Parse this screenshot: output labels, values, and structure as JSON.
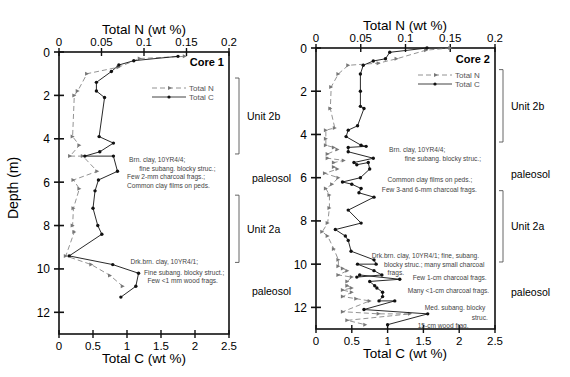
{
  "figure": {
    "y_axis_label": "Depth (m)",
    "top_axis_label": "Total N (wt %)",
    "bottom_axis_label": "Total C (wt %)"
  },
  "chart_data": [
    {
      "type": "line",
      "title": "Core 1",
      "ylabel": "Depth (m)",
      "xlabel_bottom": "Total C (wt %)",
      "xlabel_top": "Total N (wt %)",
      "ylim": [
        13,
        0
      ],
      "xlim_bottom": [
        0,
        2.5
      ],
      "xlim_top": [
        0,
        0.2
      ],
      "y_ticks": [
        0,
        2,
        4,
        6,
        8,
        10,
        12
      ],
      "x_ticks_bottom": [
        0,
        0.5,
        1,
        1.5,
        2,
        2.5
      ],
      "x_ticks_top": [
        0,
        0.05,
        0.1,
        0.15,
        0.2
      ],
      "x_tick_labels_bottom": [
        "0",
        "0.5",
        "1",
        "1.5",
        "2",
        "2.5"
      ],
      "x_tick_labels_top": [
        "0",
        "0.05",
        "0.1",
        "0.15",
        "0.2"
      ],
      "legend": [
        "Total N",
        "Total C"
      ],
      "legend_position": "upper right",
      "grid": false,
      "series": [
        {
          "name": "Total N",
          "axis": "top",
          "style": "dashed",
          "marker": "arrow",
          "color": "#777777",
          "points": [
            [
              0.148,
              0.2
            ],
            [
              0.095,
              0.3
            ],
            [
              0.07,
              0.7
            ],
            [
              0.033,
              1.0
            ],
            [
              0.022,
              1.8
            ],
            [
              0.018,
              2.0
            ],
            [
              0.016,
              3.9
            ],
            [
              0.024,
              4.3
            ],
            [
              0.013,
              4.8
            ],
            [
              0.028,
              4.8
            ],
            [
              0.045,
              5.5
            ],
            [
              0.017,
              5.9
            ],
            [
              0.024,
              6.3
            ],
            [
              0.017,
              7.2
            ],
            [
              0.016,
              8.0
            ],
            [
              0.018,
              8.3
            ],
            [
              0.008,
              9.4
            ],
            [
              0.038,
              9.8
            ],
            [
              0.06,
              10.3
            ],
            [
              0.075,
              10.8
            ]
          ]
        },
        {
          "name": "Total C",
          "axis": "bottom",
          "style": "solid",
          "marker": "circle",
          "color": "#111111",
          "points": [
            [
              1.75,
              0.2
            ],
            [
              1.1,
              0.4
            ],
            [
              0.88,
              0.6
            ],
            [
              0.77,
              0.9
            ],
            [
              0.55,
              1.4
            ],
            [
              0.55,
              1.8
            ],
            [
              0.67,
              2.1
            ],
            [
              0.59,
              3.9
            ],
            [
              0.8,
              4.2
            ],
            [
              0.6,
              4.6
            ],
            [
              0.38,
              4.8
            ],
            [
              0.8,
              4.8
            ],
            [
              0.86,
              5.5
            ],
            [
              0.58,
              5.9
            ],
            [
              0.53,
              6.4
            ],
            [
              0.5,
              7.2
            ],
            [
              0.57,
              8.0
            ],
            [
              0.63,
              8.4
            ],
            [
              0.15,
              9.4
            ],
            [
              0.79,
              9.8
            ],
            [
              1.17,
              10.2
            ],
            [
              1.13,
              10.8
            ],
            [
              0.91,
              11.3
            ]
          ]
        }
      ],
      "annotations": [
        {
          "text": "Brn. clay, 10YR4/4;",
          "depth": 4.95,
          "x": 1.03,
          "anchor": "start"
        },
        {
          "text": "fine subang. blocky struc.;",
          "depth": 5.35,
          "x": 1.18,
          "anchor": "start"
        },
        {
          "text": "Few  2-mm charcoal frags.;",
          "depth": 5.75,
          "x": 1.0,
          "anchor": "start"
        },
        {
          "text": "Common clay films on peds.",
          "depth": 6.15,
          "x": 1.0,
          "anchor": "start"
        },
        {
          "text": "Drk.brn. clay, 10YR4/1;",
          "depth": 9.65,
          "x": 1.05,
          "anchor": "start"
        },
        {
          "text": "Fine subang. blocky struct.;",
          "depth": 10.15,
          "x": 1.25,
          "anchor": "start"
        },
        {
          "text": "Few  <1 mm wood frags.",
          "depth": 10.55,
          "x": 1.3,
          "anchor": "start"
        }
      ],
      "units": [
        {
          "label": "Unit 2b",
          "bracket": [
            1.2,
            4.7
          ]
        },
        {
          "label": "paleosol",
          "depth": 5.8
        },
        {
          "label": "Unit 2a",
          "bracket": [
            6.6,
            9.7
          ]
        },
        {
          "label": "paleosol",
          "depth": 11.0
        }
      ]
    },
    {
      "type": "line",
      "title": "Core 2",
      "ylabel": "Depth (m)",
      "xlabel_bottom": "Total C (wt %)",
      "xlabel_top": "Total N (wt %)",
      "ylim": [
        13,
        0
      ],
      "xlim_bottom": [
        0,
        2.5
      ],
      "xlim_top": [
        0,
        0.2
      ],
      "y_ticks": [
        0,
        2,
        4,
        6,
        8,
        10,
        12
      ],
      "x_ticks_bottom": [
        0,
        0.5,
        1,
        1.5,
        2,
        2.5
      ],
      "x_ticks_top": [
        0,
        0.05,
        0.1,
        0.15,
        0.2
      ],
      "x_tick_labels_bottom": [
        "0",
        "0.5",
        "1",
        "1.5",
        "2",
        "2.5"
      ],
      "x_tick_labels_top": [
        "0",
        "0.05",
        "0.1",
        "0.15",
        "0.2"
      ],
      "legend": [
        "Total N",
        "Total C"
      ],
      "legend_position": "upper right",
      "grid": false,
      "series": [
        {
          "name": "Total N",
          "axis": "top",
          "style": "dashed",
          "marker": "arrow",
          "color": "#777777",
          "points": [
            [
              0.15,
              0.0
            ],
            [
              0.123,
              0.1
            ],
            [
              0.09,
              0.5
            ],
            [
              0.07,
              0.7
            ],
            [
              0.036,
              0.8
            ],
            [
              0.025,
              1.2
            ],
            [
              0.017,
              1.8
            ],
            [
              0.016,
              2.8
            ],
            [
              0.021,
              3.7
            ],
            [
              0.011,
              3.8
            ],
            [
              0.011,
              4.2
            ],
            [
              0.011,
              4.5
            ],
            [
              0.02,
              4.6
            ],
            [
              0.024,
              4.7
            ],
            [
              0.013,
              4.9
            ],
            [
              0.013,
              5.1
            ],
            [
              0.031,
              5.2
            ],
            [
              0.02,
              5.3
            ],
            [
              0.02,
              5.5
            ],
            [
              0.024,
              5.6
            ],
            [
              0.01,
              5.8
            ],
            [
              0.025,
              6.0
            ],
            [
              0.018,
              6.3
            ],
            [
              0.011,
              6.5
            ],
            [
              0.015,
              6.8
            ],
            [
              0.015,
              7.4
            ],
            [
              0.013,
              8.1
            ],
            [
              0.007,
              8.5
            ],
            [
              0.013,
              8.7
            ],
            [
              0.02,
              9.3
            ],
            [
              0.025,
              9.8
            ],
            [
              0.025,
              10.1
            ],
            [
              0.03,
              10.2
            ],
            [
              0.035,
              10.3
            ],
            [
              0.025,
              10.5
            ],
            [
              0.04,
              10.6
            ],
            [
              0.035,
              10.8
            ],
            [
              0.035,
              11.0
            ],
            [
              0.04,
              11.1
            ],
            [
              0.03,
              11.2
            ],
            [
              0.04,
              11.3
            ],
            [
              0.03,
              11.5
            ],
            [
              0.045,
              11.6
            ],
            [
              0.06,
              11.7
            ],
            [
              0.03,
              12.2
            ],
            [
              0.07,
              12.3
            ],
            [
              0.105,
              12.3
            ],
            [
              0.035,
              12.6
            ],
            [
              0.055,
              12.8
            ]
          ]
        },
        {
          "name": "Total C",
          "axis": "bottom",
          "style": "solid",
          "marker": "circle",
          "color": "#111111",
          "points": [
            [
              1.55,
              0.0
            ],
            [
              1.03,
              0.2
            ],
            [
              0.97,
              0.5
            ],
            [
              0.8,
              0.6
            ],
            [
              0.66,
              0.8
            ],
            [
              0.62,
              1.2
            ],
            [
              0.62,
              2.0
            ],
            [
              0.62,
              2.7
            ],
            [
              0.67,
              2.8
            ],
            [
              0.58,
              3.6
            ],
            [
              0.45,
              3.8
            ],
            [
              0.42,
              4.1
            ],
            [
              0.63,
              4.5
            ],
            [
              0.7,
              4.55
            ],
            [
              0.45,
              4.6
            ],
            [
              0.45,
              4.8
            ],
            [
              0.8,
              5.1
            ],
            [
              0.53,
              5.3
            ],
            [
              0.57,
              5.4
            ],
            [
              0.73,
              5.3
            ],
            [
              0.75,
              5.6
            ],
            [
              0.62,
              6.0
            ],
            [
              0.37,
              6.2
            ],
            [
              0.5,
              6.3
            ],
            [
              0.63,
              6.5
            ],
            [
              0.6,
              6.7
            ],
            [
              0.81,
              6.9
            ],
            [
              0.45,
              7.5
            ],
            [
              0.63,
              8.1
            ],
            [
              0.27,
              8.4
            ],
            [
              0.41,
              8.7
            ],
            [
              0.45,
              8.9
            ],
            [
              0.49,
              9.4
            ],
            [
              0.81,
              9.8
            ],
            [
              0.84,
              10.0
            ],
            [
              0.58,
              10.0
            ],
            [
              0.81,
              10.3
            ],
            [
              0.92,
              10.5
            ],
            [
              0.57,
              10.6
            ],
            [
              0.61,
              10.5
            ],
            [
              1.17,
              10.7
            ],
            [
              0.75,
              10.8
            ],
            [
              0.82,
              11.0
            ],
            [
              0.85,
              11.1
            ],
            [
              0.93,
              11.3
            ],
            [
              0.93,
              11.5
            ],
            [
              0.88,
              11.7
            ],
            [
              1.1,
              11.7
            ],
            [
              0.67,
              12.1
            ],
            [
              1.56,
              12.3
            ],
            [
              1.0,
              12.8
            ]
          ]
        }
      ],
      "annotations": [
        {
          "text": "Brn. clay, 10YR4/4;",
          "depth": 4.7,
          "x": 1.02,
          "anchor": "start"
        },
        {
          "text": "fine subang. blocky struc.;",
          "depth": 5.1,
          "x": 1.24,
          "anchor": "start"
        },
        {
          "text": "Common clay films on peds.;",
          "depth": 6.1,
          "x": 1.0,
          "anchor": "start"
        },
        {
          "text": "Few 3-and 6-mm charcoal frags.",
          "depth": 6.55,
          "x": 0.92,
          "anchor": "start"
        },
        {
          "text": "Drk.brn. clay, 10YR4/1; fine, subang.",
          "depth": 9.6,
          "x": 0.78,
          "anchor": "start"
        },
        {
          "text": "blocky struc.; many small charcoal",
          "depth": 10.0,
          "x": 0.95,
          "anchor": "start"
        },
        {
          "text": "frags.",
          "depth": 10.4,
          "x": 1.0,
          "anchor": "start"
        },
        {
          "text": "Few 1-cm charcoal frags.",
          "depth": 10.6,
          "x": 1.35,
          "anchor": "start"
        },
        {
          "text": "Many <1-cm charcoal frags.",
          "depth": 11.2,
          "x": 1.28,
          "anchor": "start"
        },
        {
          "text": "Med. subang. blocky",
          "depth": 12.0,
          "x": 1.52,
          "anchor": "start"
        },
        {
          "text": "struc.",
          "depth": 12.45,
          "x": 2.4,
          "anchor": "end"
        },
        {
          "text": "15-cm wood frag.",
          "depth": 12.85,
          "x": 1.42,
          "anchor": "start"
        }
      ],
      "units": [
        {
          "label": "Unit 2b",
          "bracket": [
            1.0,
            4.35
          ]
        },
        {
          "label": "paleosol",
          "depth": 5.85
        },
        {
          "label": "Unit 2a",
          "bracket": [
            6.6,
            9.9
          ]
        },
        {
          "label": "paleosol",
          "depth": 11.3
        }
      ]
    }
  ]
}
